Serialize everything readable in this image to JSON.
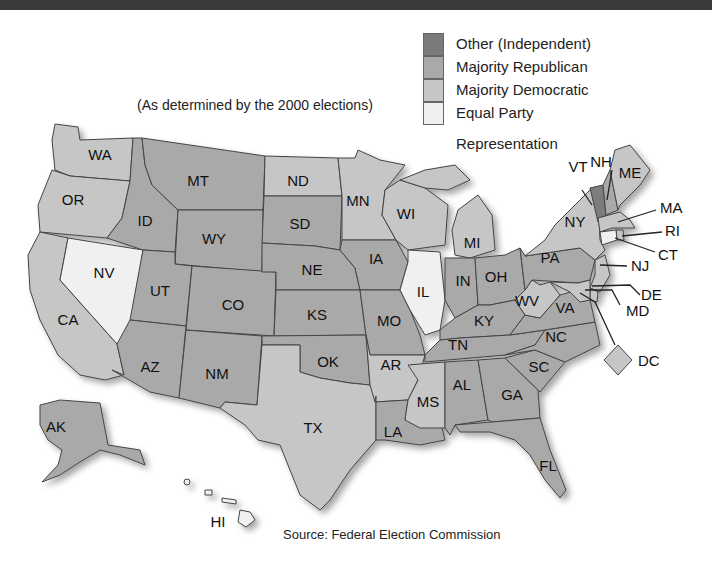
{
  "subtitle": "(As determined by the 2000 elections)",
  "source": "Source: Federal Election Commission",
  "colors": {
    "other": "#7b7b7b",
    "republican": "#a9a9a9",
    "democratic": "#c6c6c6",
    "equal": "#f0f0f0"
  },
  "legend": [
    {
      "key": "other",
      "label": "Other (Independent)"
    },
    {
      "key": "republican",
      "label": "Majority Republican"
    },
    {
      "key": "democratic",
      "label": "Majority Democratic"
    },
    {
      "key": "equal",
      "label": "Equal Party",
      "label2": "Representation"
    }
  ],
  "states": {
    "WA": "democratic",
    "OR": "democratic",
    "CA": "democratic",
    "NV": "equal",
    "ID": "republican",
    "MT": "republican",
    "WY": "republican",
    "UT": "republican",
    "CO": "republican",
    "AZ": "republican",
    "NM": "republican",
    "ND": "democratic",
    "SD": "republican",
    "NE": "republican",
    "KS": "republican",
    "OK": "republican",
    "TX": "democratic",
    "MN": "democratic",
    "IA": "republican",
    "MO": "republican",
    "AR": "democratic",
    "LA": "republican",
    "WI": "democratic",
    "IL": "equal",
    "MI": "democratic",
    "IN": "republican",
    "OH": "republican",
    "KY": "republican",
    "TN": "republican",
    "MS": "democratic",
    "AL": "republican",
    "GA": "republican",
    "FL": "republican",
    "SC": "republican",
    "NC": "republican",
    "VA": "republican",
    "WV": "democratic",
    "PA": "republican",
    "NY": "democratic",
    "VT": "other",
    "NH": "republican",
    "ME": "democratic",
    "MA": "democratic",
    "RI": "democratic",
    "CT": "equal",
    "NJ": "democratic",
    "DE": "democratic",
    "MD": "democratic",
    "DC": "democratic",
    "AK": "republican",
    "HI": "equal"
  },
  "labels": {
    "WA": "WA",
    "OR": "OR",
    "CA": "CA",
    "NV": "NV",
    "ID": "ID",
    "MT": "MT",
    "WY": "WY",
    "UT": "UT",
    "CO": "CO",
    "AZ": "AZ",
    "NM": "NM",
    "ND": "ND",
    "SD": "SD",
    "NE": "NE",
    "KS": "KS",
    "OK": "OK",
    "TX": "TX",
    "MN": "MN",
    "IA": "IA",
    "MO": "MO",
    "AR": "AR",
    "LA": "LA",
    "WI": "WI",
    "IL": "IL",
    "MI": "MI",
    "IN": "IN",
    "OH": "OH",
    "KY": "KY",
    "TN": "TN",
    "MS": "MS",
    "AL": "AL",
    "GA": "GA",
    "FL": "FL",
    "SC": "SC",
    "NC": "NC",
    "VA": "VA",
    "WV": "WV",
    "PA": "PA",
    "NY": "NY",
    "VT": "VT",
    "NH": "NH",
    "ME": "ME",
    "MA": "MA",
    "RI": "RI",
    "CT": "CT",
    "NJ": "NJ",
    "DE": "DE",
    "MD": "MD",
    "DC": "DC",
    "AK": "AK",
    "HI": "HI"
  }
}
